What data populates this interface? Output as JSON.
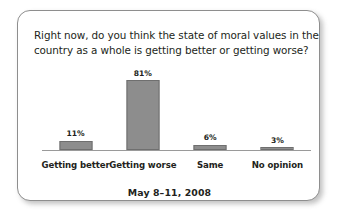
{
  "card": {
    "question_line1": "Right now, do you think the state of moral values in the",
    "question_line2": "country as a whole is getting better or getting worse?",
    "footer_date": "May 8–11, 2008"
  },
  "chart_data": {
    "type": "bar",
    "title": "Right now, do you think the state of moral values in the country as a whole is getting better or getting worse?",
    "subtitle": "May 8–11, 2008",
    "categories": [
      "Getting better",
      "Getting worse",
      "Same",
      "No opinion"
    ],
    "values": [
      11,
      81,
      6,
      3
    ],
    "value_labels": [
      "11%",
      "81%",
      "6%",
      "3%"
    ],
    "xlabel": "",
    "ylabel": "",
    "ylim": [
      0,
      100
    ],
    "grid": false,
    "legend": "none",
    "bar_color": "#8d8d8d",
    "bar_border_color": "#6f6f6f",
    "axis_color": "#9a9a9a",
    "text_color": "#231f20",
    "card_border_color": "#8e8e8e",
    "background": "#ffffff"
  }
}
